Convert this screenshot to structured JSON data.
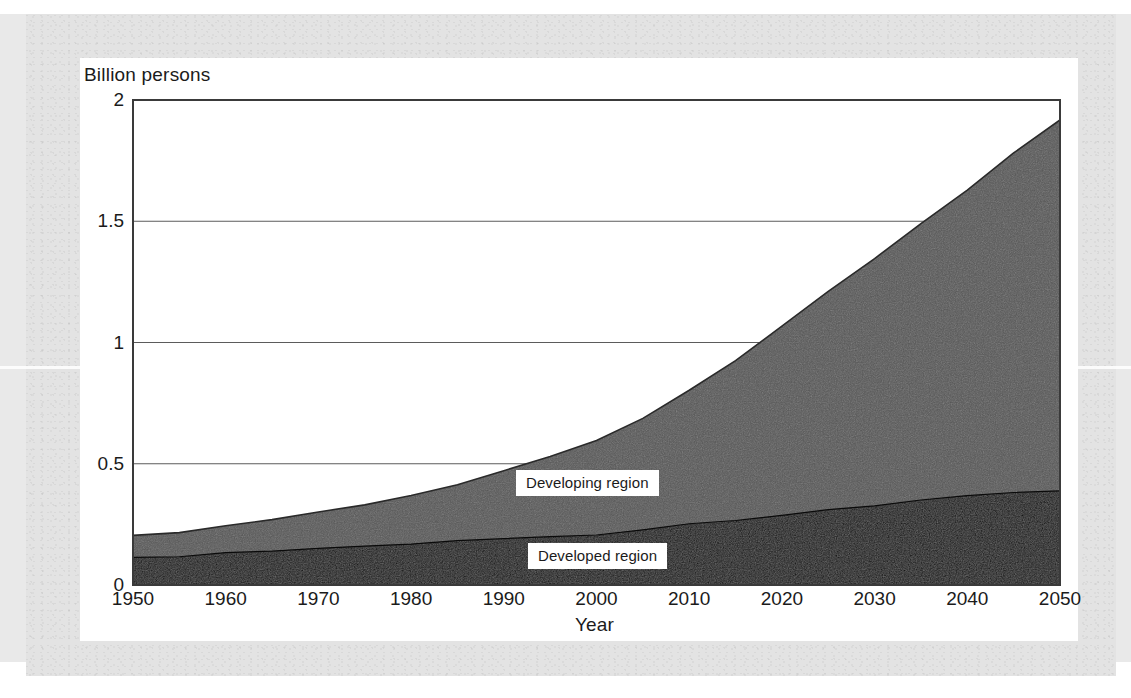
{
  "figure": {
    "background_color": "#e9e9e9",
    "card_color": "#ffffff"
  },
  "chart_data": {
    "type": "area",
    "stacked": true,
    "title": "",
    "subtitle": "",
    "xlabel": "Year",
    "ylabel": "Billion persons",
    "ylim": [
      0,
      2
    ],
    "xlim": [
      1950,
      2050
    ],
    "grid": true,
    "grid_axis": "y",
    "legend_position": "inline-annotation",
    "ytick_labels": [
      "0",
      "0.5",
      "1",
      "1.5",
      "2"
    ],
    "ytick_values": [
      0,
      0.5,
      1,
      1.5,
      2
    ],
    "xtick_labels": [
      "1950",
      "1960",
      "1970",
      "1980",
      "1990",
      "2000",
      "2010",
      "2020",
      "2030",
      "2040",
      "2050"
    ],
    "xtick_values": [
      1950,
      1960,
      1970,
      1980,
      1990,
      2000,
      2010,
      2020,
      2030,
      2040,
      2050
    ],
    "x": [
      1950,
      1955,
      1960,
      1965,
      1970,
      1975,
      1980,
      1985,
      1990,
      1995,
      2000,
      2005,
      2010,
      2015,
      2020,
      2025,
      2030,
      2035,
      2040,
      2045,
      2050
    ],
    "series": [
      {
        "name": "Developed region",
        "color": "#0a0a0a",
        "values": [
          0.11,
          0.12,
          0.13,
          0.14,
          0.15,
          0.16,
          0.17,
          0.18,
          0.19,
          0.2,
          0.21,
          0.23,
          0.25,
          0.27,
          0.29,
          0.31,
          0.33,
          0.35,
          0.37,
          0.38,
          0.39
        ]
      },
      {
        "name": "Developing region",
        "color": "#565656",
        "values": [
          0.09,
          0.1,
          0.11,
          0.13,
          0.15,
          0.17,
          0.2,
          0.23,
          0.28,
          0.33,
          0.39,
          0.46,
          0.55,
          0.66,
          0.78,
          0.9,
          1.02,
          1.14,
          1.26,
          1.4,
          1.53
        ]
      }
    ],
    "totals": [
      0.2,
      0.22,
      0.24,
      0.27,
      0.3,
      0.33,
      0.37,
      0.41,
      0.47,
      0.53,
      0.6,
      0.69,
      0.8,
      0.93,
      1.07,
      1.21,
      1.35,
      1.49,
      1.63,
      1.78,
      1.92
    ],
    "annotations": [
      {
        "text": "Developing region",
        "series": "Developing region"
      },
      {
        "text": "Developed region",
        "series": "Developed region"
      }
    ]
  },
  "axes": {
    "y_title": "Billion persons",
    "x_title": "Year"
  },
  "labels": {
    "developing": "Developing region",
    "developed": "Developed region"
  }
}
